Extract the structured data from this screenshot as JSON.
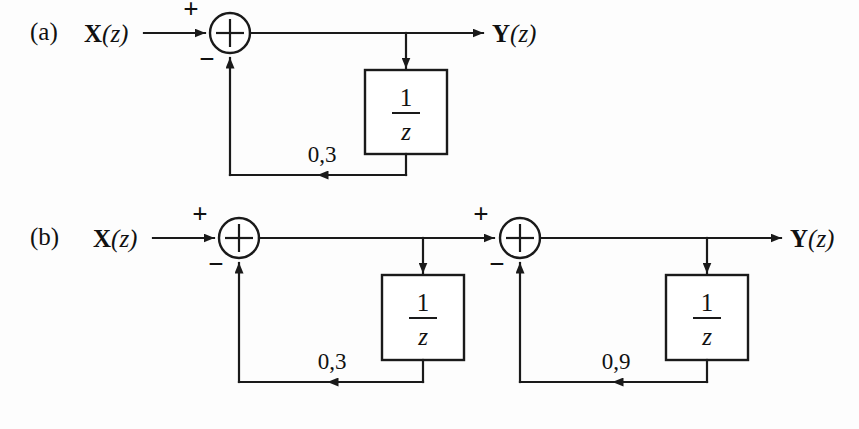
{
  "figure": {
    "type": "signal-flow-block-diagram",
    "background_color": "#fdfdfd",
    "line_color": "#1a1a1a",
    "panels": [
      {
        "id": "a",
        "label": "(a)",
        "input_label_var": "X",
        "input_label_arg": "(z)",
        "output_label_var": "Y",
        "output_label_arg": "(z)",
        "summers": [
          {
            "id": "a-sum-1",
            "glyph": "+",
            "input_sign": "+",
            "feedback_sign": "−"
          }
        ],
        "delay_blocks": [
          {
            "id": "a-delay-1",
            "numerator": "1",
            "denominator": "z"
          }
        ],
        "gains": [
          {
            "id": "a-gain-1",
            "value": "0,3"
          }
        ]
      },
      {
        "id": "b",
        "label": "(b)",
        "input_label_var": "X",
        "input_label_arg": "(z)",
        "output_label_var": "Y",
        "output_label_arg": "(z)",
        "summers": [
          {
            "id": "b-sum-1",
            "glyph": "+",
            "input_sign": "+",
            "feedback_sign": "−"
          },
          {
            "id": "b-sum-2",
            "glyph": "+",
            "input_sign": "+",
            "feedback_sign": "−"
          }
        ],
        "delay_blocks": [
          {
            "id": "b-delay-1",
            "numerator": "1",
            "denominator": "z"
          },
          {
            "id": "b-delay-2",
            "numerator": "1",
            "denominator": "z"
          }
        ],
        "gains": [
          {
            "id": "b-gain-1",
            "value": "0,3"
          },
          {
            "id": "b-gain-2",
            "value": "0,9"
          }
        ]
      }
    ]
  }
}
